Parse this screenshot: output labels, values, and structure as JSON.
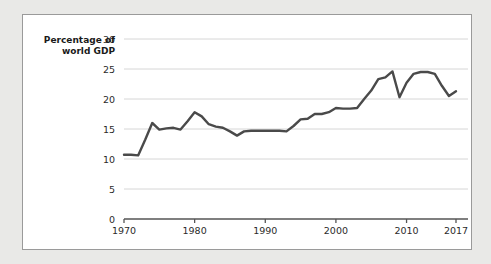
{
  "chart_data": {
    "type": "line",
    "title": "",
    "subtitle": "",
    "xlabel": "",
    "ylabel": "Percentage of world GDP",
    "ylabel_lines": [
      "Percentage of",
      "world GDP"
    ],
    "xlim": [
      1970,
      2017
    ],
    "ylim": [
      0,
      30
    ],
    "ytick_labels": [
      "0",
      "5",
      "10",
      "15",
      "20",
      "25",
      "30"
    ],
    "ytick_values": [
      0,
      5,
      10,
      15,
      20,
      25,
      30
    ],
    "xtick_labels": [
      "1970",
      "1980",
      "1990",
      "2000",
      "2010",
      "2017"
    ],
    "xtick_values": [
      1970,
      1980,
      1990,
      2000,
      2010,
      2017
    ],
    "grid": "horizontal",
    "legend": "none",
    "line_color": "#4a4a4a",
    "grid_color": "#d6d6d6",
    "axis_color": "#555555",
    "x": [
      1970,
      1971,
      1972,
      1973,
      1974,
      1975,
      1976,
      1977,
      1978,
      1979,
      1980,
      1981,
      1982,
      1983,
      1984,
      1985,
      1986,
      1987,
      1988,
      1989,
      1990,
      1991,
      1992,
      1993,
      1994,
      1995,
      1996,
      1997,
      1998,
      1999,
      2000,
      2001,
      2002,
      2003,
      2004,
      2005,
      2006,
      2007,
      2008,
      2009,
      2010,
      2011,
      2012,
      2013,
      2014,
      2015,
      2016,
      2017
    ],
    "values": [
      10.7,
      10.7,
      10.6,
      13.2,
      16.0,
      14.9,
      15.1,
      15.2,
      14.9,
      16.3,
      17.8,
      17.1,
      15.8,
      15.4,
      15.2,
      14.6,
      13.9,
      14.6,
      14.7,
      14.7,
      14.7,
      14.7,
      14.7,
      14.6,
      15.5,
      16.6,
      16.7,
      17.5,
      17.5,
      17.8,
      18.5,
      18.4,
      18.4,
      18.5,
      20.0,
      21.4,
      23.3,
      23.6,
      24.6,
      20.3,
      22.7,
      24.2,
      24.5,
      24.5,
      24.2,
      22.2,
      20.5,
      21.3
    ]
  }
}
